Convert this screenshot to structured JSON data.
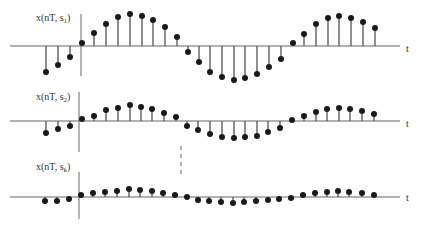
{
  "diagram": {
    "colors": {
      "stem": "#444444",
      "dot": "#1a1a1a",
      "axis": "#666666",
      "text": "#333333"
    },
    "plots": [
      {
        "id": "s1",
        "ylabel_main": "x(nT, s",
        "ylabel_sub": "1",
        "ylabel_close": ")",
        "xlabel": "t",
        "baseline_y": 46,
        "axis_x": 81,
        "axis_top": 14,
        "axis_bottom": 76,
        "label_x": 36,
        "label_y": 13,
        "xlabel_x": 406,
        "xlabel_y": 44,
        "samples": [
          [
            46,
            72
          ],
          [
            58,
            65
          ],
          [
            70,
            57
          ],
          [
            82,
            43
          ],
          [
            94,
            33
          ],
          [
            106,
            24
          ],
          [
            118,
            17
          ],
          [
            130,
            14
          ],
          [
            142,
            16
          ],
          [
            153,
            20
          ],
          [
            165,
            27
          ],
          [
            177,
            37
          ],
          [
            188,
            52
          ],
          [
            199,
            62
          ],
          [
            210,
            72
          ],
          [
            222,
            77
          ],
          [
            234,
            80
          ],
          [
            245,
            78
          ],
          [
            257,
            74
          ],
          [
            269,
            67
          ],
          [
            281,
            59
          ],
          [
            293,
            43
          ],
          [
            304,
            34
          ],
          [
            316,
            24
          ],
          [
            328,
            18
          ],
          [
            339,
            16
          ],
          [
            351,
            18
          ],
          [
            363,
            22
          ],
          [
            375,
            28
          ]
        ]
      },
      {
        "id": "s2",
        "ylabel_main": "x(nT, s",
        "ylabel_sub": "2",
        "ylabel_close": ")",
        "xlabel": "t",
        "baseline_y": 121,
        "axis_x": 79,
        "axis_top": 92,
        "axis_bottom": 152,
        "label_x": 36,
        "label_y": 92,
        "xlabel_x": 406,
        "xlabel_y": 119,
        "samples": [
          [
            46,
            133
          ],
          [
            58,
            129
          ],
          [
            70,
            126
          ],
          [
            82,
            119
          ],
          [
            94,
            116
          ],
          [
            106,
            110
          ],
          [
            118,
            108
          ],
          [
            130,
            105
          ],
          [
            141,
            107
          ],
          [
            152,
            109
          ],
          [
            164,
            113
          ],
          [
            176,
            117
          ],
          [
            187,
            126
          ],
          [
            198,
            130
          ],
          [
            210,
            134
          ],
          [
            222,
            137
          ],
          [
            234,
            138
          ],
          [
            245,
            137
          ],
          [
            257,
            136
          ],
          [
            268,
            132
          ],
          [
            280,
            128
          ],
          [
            292,
            120
          ],
          [
            304,
            116
          ],
          [
            316,
            112
          ],
          [
            327,
            109
          ],
          [
            339,
            108
          ],
          [
            350,
            109
          ],
          [
            362,
            111
          ],
          [
            374,
            114
          ]
        ]
      },
      {
        "id": "sk",
        "ylabel_main": "x(nT, s",
        "ylabel_sub": "k",
        "ylabel_close": ")",
        "xlabel": "t",
        "baseline_y": 197,
        "axis_x": 79,
        "axis_top": 172,
        "axis_bottom": 219,
        "label_x": 36,
        "label_y": 162,
        "xlabel_x": 406,
        "xlabel_y": 193,
        "samples": [
          [
            45,
            201
          ],
          [
            57,
            201
          ],
          [
            69,
            199
          ],
          [
            81,
            195
          ],
          [
            93,
            193
          ],
          [
            105,
            192
          ],
          [
            117,
            191
          ],
          [
            129,
            189
          ],
          [
            140,
            190
          ],
          [
            152,
            191
          ],
          [
            163,
            193
          ],
          [
            175,
            195
          ],
          [
            187,
            197
          ],
          [
            198,
            200
          ],
          [
            209,
            201
          ],
          [
            221,
            202
          ],
          [
            233,
            203
          ],
          [
            244,
            202
          ],
          [
            256,
            201
          ],
          [
            268,
            200
          ],
          [
            279,
            199
          ],
          [
            291,
            198
          ],
          [
            303,
            195
          ],
          [
            315,
            193
          ],
          [
            327,
            192
          ],
          [
            338,
            191
          ],
          [
            349,
            192
          ],
          [
            362,
            193
          ],
          [
            374,
            195
          ]
        ]
      }
    ],
    "baseline": {
      "x_start": 10,
      "x_end": 400
    },
    "dashed_marker": {
      "x": 181,
      "y_start": 146,
      "y_end": 174
    }
  }
}
